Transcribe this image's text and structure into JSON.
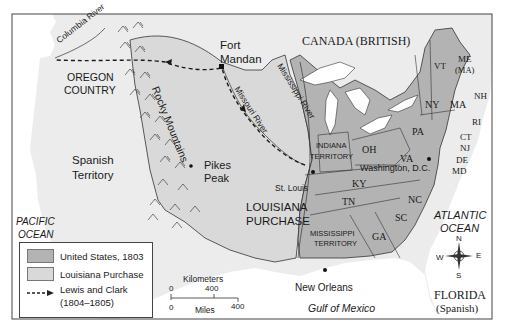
{
  "map": {
    "colors": {
      "frame": "#444444",
      "water": "#ffffff",
      "foreign_land": "#ececec",
      "louisiana_purchase": "#d9d9d9",
      "united_states_1803": "#b3b3b3",
      "route": "#1a1a1a"
    },
    "regions": {
      "canada": "CANADA (BRITISH)",
      "oregon": [
        "OREGON",
        "COUNTRY"
      ],
      "spanish_territory": [
        "Spanish",
        "Territory"
      ],
      "louisiana": [
        "LOUISIANA",
        "PURCHASE"
      ],
      "indiana": [
        "INDIANA",
        "TERRITORY"
      ],
      "mississippi": [
        "MISSISSIPPI",
        "TERRITORY"
      ],
      "florida": [
        "FLORIDA",
        "(Spanish)"
      ]
    },
    "states": [
      "VT",
      "ME",
      "(MA)",
      "NH",
      "NY",
      "MA",
      "RI",
      "CT",
      "NJ",
      "DE",
      "MD",
      "PA",
      "OH",
      "VA",
      "KY",
      "TN",
      "NC",
      "SC",
      "GA"
    ],
    "places": {
      "fort_mandan": [
        "Fort",
        "Mandan"
      ],
      "pikes_peak": [
        "Pikes",
        "Peak"
      ],
      "st_louis": "St. Louis",
      "washington": "Washington, D.C.",
      "new_orleans": "New Orleans"
    },
    "physical": {
      "columbia": "Columbia River",
      "rocky": "Rocky Mountains",
      "missouri": "Missouri River",
      "mississippi": "Mississippi River"
    },
    "water_bodies": {
      "pacific": [
        "PACIFIC",
        "OCEAN"
      ],
      "atlantic": [
        "ATLANTIC",
        "OCEAN"
      ],
      "gulf": "Gulf of Mexico"
    },
    "compass": {
      "n": "N",
      "s": "S",
      "e": "E",
      "w": "W"
    },
    "scale": {
      "km_label": "Kilometers",
      "km_zero": "0",
      "km_400": "400",
      "mi_zero": "0",
      "mi_label": "Miles",
      "mi_400": "400"
    }
  },
  "legend": {
    "items": [
      {
        "label": "United States, 1803",
        "swatch": "#b3b3b3"
      },
      {
        "label": "Louisiana Purchase",
        "swatch": "#d9d9d9"
      },
      {
        "label": "Lewis and Clark",
        "sub": "(1804–1805)"
      }
    ]
  }
}
